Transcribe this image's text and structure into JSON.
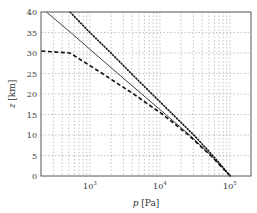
{
  "chart_data": {
    "type": "line",
    "title": "",
    "xlabel_var": "p",
    "xlabel_unit": "[Pa]",
    "ylabel_var": "z",
    "ylabel_unit": "[km]",
    "xscale": "log",
    "xlim": [
      200,
      200000
    ],
    "ylim": [
      0,
      40
    ],
    "grid": true,
    "legend": null,
    "xticks": [
      {
        "value": 1000,
        "label_base": "10",
        "label_exp": "3"
      },
      {
        "value": 10000,
        "label_base": "10",
        "label_exp": "4"
      },
      {
        "value": 100000,
        "label_base": "10",
        "label_exp": "5"
      }
    ],
    "yticks": [
      "0",
      "5",
      "10",
      "15",
      "20",
      "25",
      "30",
      "35",
      "40"
    ],
    "series": [
      {
        "name": "solid",
        "style": "solid",
        "points": [
          [
            101325,
            0
          ],
          [
            54000,
            5
          ],
          [
            26500,
            10
          ],
          [
            12100,
            15
          ],
          [
            5500,
            20
          ],
          [
            2500,
            25
          ],
          [
            1150,
            30
          ],
          [
            530,
            35
          ],
          [
            240,
            40
          ]
        ]
      },
      {
        "name": "dotted",
        "style": "dotted",
        "points": [
          [
            101325,
            0
          ],
          [
            57000,
            5
          ],
          [
            30500,
            10
          ],
          [
            15300,
            15
          ],
          [
            7700,
            20
          ],
          [
            3900,
            25
          ],
          [
            2000,
            30
          ],
          [
            1000,
            35
          ],
          [
            520,
            40
          ]
        ]
      },
      {
        "name": "dashed",
        "style": "dashed",
        "points": [
          [
            101325,
            0
          ],
          [
            53000,
            5
          ],
          [
            25500,
            10
          ],
          [
            11000,
            15
          ],
          [
            4200,
            20
          ],
          [
            1500,
            25
          ],
          [
            520,
            30
          ],
          [
            200,
            30.5
          ]
        ]
      }
    ]
  }
}
